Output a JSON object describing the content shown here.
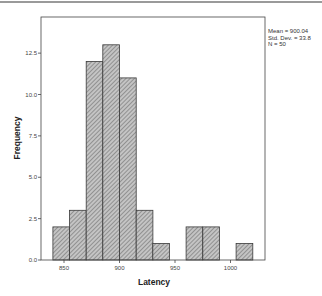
{
  "chart_data": {
    "type": "bar",
    "subtype": "histogram",
    "title": "",
    "xlabel": "Latency",
    "ylabel": "Frequency",
    "bin_width": 15,
    "bins": [
      {
        "start": 840,
        "end": 855,
        "count": 2
      },
      {
        "start": 855,
        "end": 870,
        "count": 3
      },
      {
        "start": 870,
        "end": 885,
        "count": 12
      },
      {
        "start": 885,
        "end": 900,
        "count": 13
      },
      {
        "start": 900,
        "end": 915,
        "count": 11
      },
      {
        "start": 915,
        "end": 930,
        "count": 3
      },
      {
        "start": 930,
        "end": 945,
        "count": 1
      },
      {
        "start": 945,
        "end": 960,
        "count": 0
      },
      {
        "start": 960,
        "end": 975,
        "count": 2
      },
      {
        "start": 975,
        "end": 990,
        "count": 2
      },
      {
        "start": 990,
        "end": 1005,
        "count": 0
      },
      {
        "start": 1005,
        "end": 1020,
        "count": 1
      }
    ],
    "categories": [
      "840-855",
      "855-870",
      "870-885",
      "885-900",
      "900-915",
      "915-930",
      "930-945",
      "945-960",
      "960-975",
      "975-990",
      "990-1005",
      "1005-1020"
    ],
    "values": [
      2,
      3,
      12,
      13,
      11,
      3,
      1,
      0,
      2,
      2,
      0,
      1
    ],
    "xticks": [
      "850",
      "900",
      "950",
      "1000"
    ],
    "xtick_values": [
      850,
      900,
      950,
      1000
    ],
    "yticks": [
      "0.0",
      "2.5",
      "5.0",
      "7.5",
      "10.0",
      "12.5"
    ],
    "ytick_values": [
      0,
      2.5,
      5,
      7.5,
      10,
      12.5
    ],
    "xlim": [
      830,
      1032
    ],
    "ylim": [
      0,
      14.6
    ],
    "grid": false,
    "legend": {
      "position": "top-right outside",
      "entries": [
        "Mean = 900.04",
        "Std. Dev. = 33.8",
        "N = 50"
      ]
    },
    "colors": {
      "bar_fill": "#c4c4c4",
      "hatch": "#6e6e6e",
      "bar_border": "#3a3a3a",
      "axis": "#333333"
    }
  }
}
